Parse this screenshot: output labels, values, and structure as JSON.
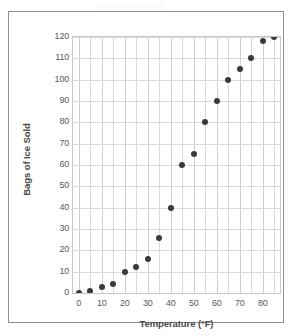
{
  "chart_data": {
    "type": "scatter",
    "title": "",
    "xlabel": "Temperature (°F)",
    "ylabel": "Bags of Ice Sold",
    "xlim": [
      -2.5,
      87.5
    ],
    "ylim": [
      0,
      120
    ],
    "x_ticks": [
      "0",
      "10",
      "20",
      "30",
      "40",
      "50",
      "60",
      "70",
      "80"
    ],
    "x_tick_values": [
      0,
      10,
      20,
      30,
      40,
      50,
      60,
      70,
      80
    ],
    "y_ticks": [
      "0",
      "10",
      "20",
      "30",
      "40",
      "50",
      "60",
      "70",
      "80",
      "90",
      "100",
      "110",
      "120"
    ],
    "y_tick_values": [
      0,
      10,
      20,
      30,
      40,
      50,
      60,
      70,
      80,
      90,
      100,
      110,
      120
    ],
    "grid": "both-axes-light",
    "legend": "none",
    "marker": "filled-circle",
    "marker_color": "#3a3a3a",
    "gridline_color": "#d9d9d9",
    "plot_border_color": "#c8c8c8",
    "frame_border_color": "#8f8f8f",
    "background": "#ffffff",
    "series": [
      {
        "name": "Bags of Ice Sold vs Temperature",
        "points": [
          {
            "x": 0,
            "y": 0
          },
          {
            "x": 5,
            "y": 1
          },
          {
            "x": 10,
            "y": 3
          },
          {
            "x": 15,
            "y": 4
          },
          {
            "x": 20,
            "y": 10
          },
          {
            "x": 25,
            "y": 12
          },
          {
            "x": 30,
            "y": 16
          },
          {
            "x": 35,
            "y": 26
          },
          {
            "x": 40,
            "y": 40
          },
          {
            "x": 45,
            "y": 60
          },
          {
            "x": 50,
            "y": 65
          },
          {
            "x": 55,
            "y": 80
          },
          {
            "x": 60,
            "y": 90
          },
          {
            "x": 65,
            "y": 100
          },
          {
            "x": 70,
            "y": 105
          },
          {
            "x": 75,
            "y": 110
          },
          {
            "x": 80,
            "y": 118
          },
          {
            "x": 85,
            "y": 120
          }
        ]
      }
    ]
  }
}
